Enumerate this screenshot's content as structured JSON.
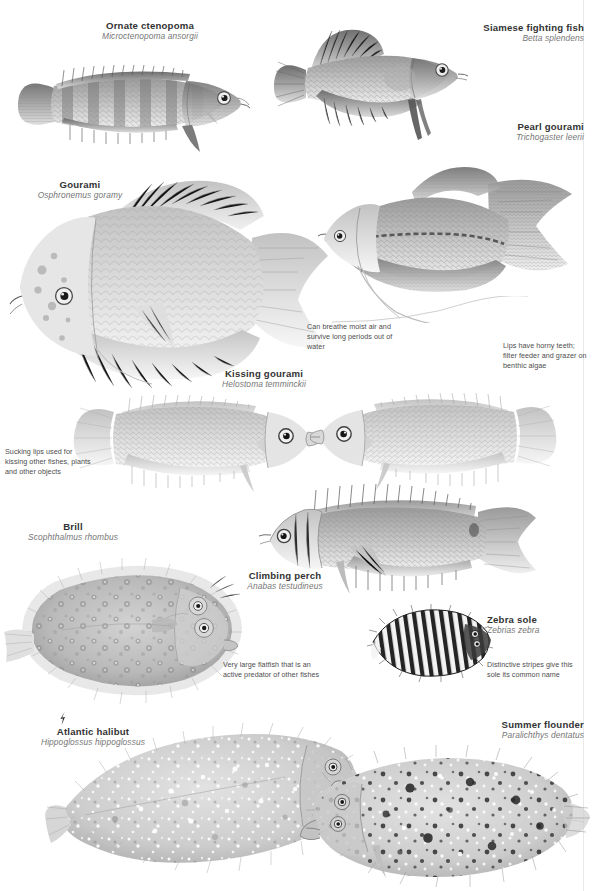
{
  "page": {
    "background": "#ffffff",
    "width": 594,
    "height": 891,
    "text_color_common": "#333333",
    "text_color_scientific": "#767676",
    "text_color_note": "#4d4d4d",
    "rule_color": "#e9e9e9"
  },
  "species": [
    {
      "id": "ornate-ctenopoma",
      "common": "Ornate ctenopoma",
      "scientific": "Microctenopoma ansorgii"
    },
    {
      "id": "siamese-fighting-fish",
      "common": "Siamese fighting fish",
      "scientific": "Betta splendens"
    },
    {
      "id": "pearl-gourami",
      "common": "Pearl gourami",
      "scientific": "Trichogaster leerii"
    },
    {
      "id": "gourami",
      "common": "Gourami",
      "scientific": "Osphronemus goramy"
    },
    {
      "id": "kissing-gourami",
      "common": "Kissing gourami",
      "scientific": "Helostoma temminckii"
    },
    {
      "id": "brill",
      "common": "Brill",
      "scientific": "Scophthalmus rhombus"
    },
    {
      "id": "climbing-perch",
      "common": "Climbing perch",
      "scientific": "Anabas testudineus"
    },
    {
      "id": "zebra-sole",
      "common": "Zebra sole",
      "scientific": "Zebrias zebra"
    },
    {
      "id": "atlantic-halibut",
      "common": "Atlantic halibut",
      "scientific": "Hippoglossus hippoglossus"
    },
    {
      "id": "summer-flounder",
      "common": "Summer flounder",
      "scientific": "Paralichthys dentatus"
    }
  ],
  "notes": [
    {
      "id": "note-air-breathing",
      "text": "Can breathe moist air and survive long periods out of water"
    },
    {
      "id": "note-horny-teeth",
      "text": "Lips have horny teeth; filter feeder and grazer on benthic algae"
    },
    {
      "id": "note-sucking-lips",
      "text": "Sucking lips used for kissing other fishes, plants and other objects"
    },
    {
      "id": "note-large-flatfish",
      "text": "Very large flatfish that is an active predator of other fishes"
    },
    {
      "id": "note-zebra-stripes",
      "text": "Distinctive stripes give this sole its common name"
    }
  ],
  "marker": {
    "id": "halibut-status-marker",
    "name": "status-marker-icon",
    "color": "#2e2e2e"
  }
}
